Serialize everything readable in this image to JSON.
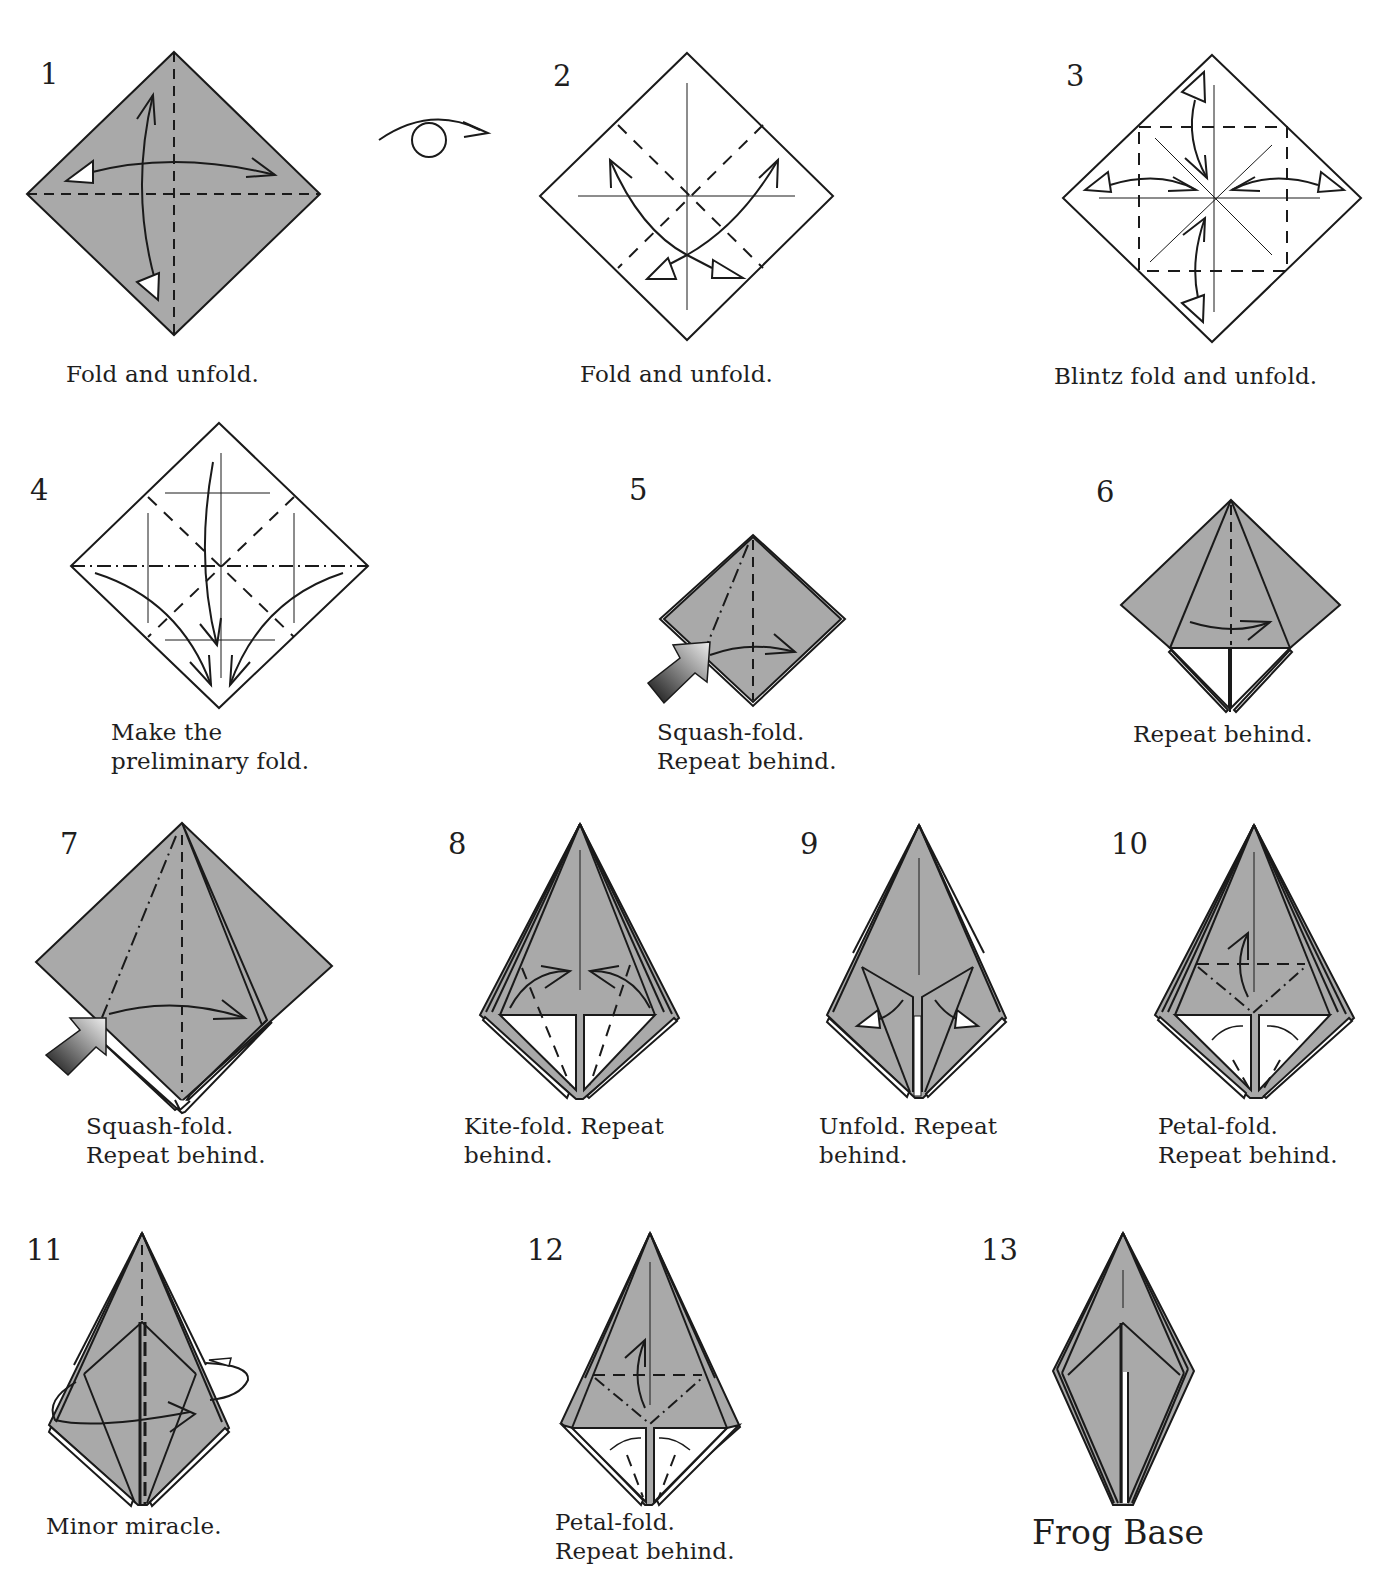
{
  "page": {
    "title": "Frog Base",
    "top_cropped_text": "... the steps are fully ..."
  },
  "colors": {
    "paper_colored": "#a9a9a9",
    "paper_white": "#ffffff",
    "line": "#1a1a1a",
    "push_arrow_dark": "#1a1a1a",
    "push_arrow_light": "#e0e0e0"
  },
  "symbols": {
    "turn_over": "turn-over-symbol"
  },
  "steps": [
    {
      "number": "1",
      "caption": "Fold and unfold."
    },
    {
      "number": "2",
      "caption": "Fold and unfold."
    },
    {
      "number": "3",
      "caption": "Blintz fold and unfold."
    },
    {
      "number": "4",
      "caption": "Make the\npreliminary fold."
    },
    {
      "number": "5",
      "caption": "Squash-fold.\nRepeat behind."
    },
    {
      "number": "6",
      "caption": "Repeat behind."
    },
    {
      "number": "7",
      "caption": "Squash-fold.\nRepeat behind."
    },
    {
      "number": "8",
      "caption": "Kite-fold. Repeat\nbehind."
    },
    {
      "number": "9",
      "caption": "Unfold. Repeat\nbehind."
    },
    {
      "number": "10",
      "caption": "Petal-fold.\nRepeat behind."
    },
    {
      "number": "11",
      "caption": "Minor miracle."
    },
    {
      "number": "12",
      "caption": "Petal-fold.\nRepeat behind."
    },
    {
      "number": "13",
      "caption": "Frog Base"
    }
  ]
}
